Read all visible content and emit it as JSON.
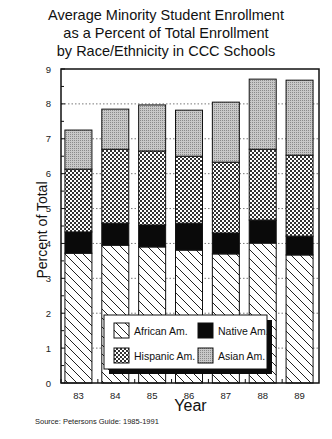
{
  "chart": {
    "title_lines": [
      "Average Minority Student Enrollment",
      "as a Percent of Total Enrollment",
      "by Race/Ethnicity in CCC Schools"
    ],
    "ylabel": "Percent of Total",
    "xlabel": "Year",
    "source": "Source: Petersons Guide: 1985-1991"
  },
  "chart_data": {
    "type": "bar",
    "stacked": true,
    "title": "Average Minority Student Enrollment as a Percent of Total Enrollment by Race/Ethnicity in CCC Schools",
    "xlabel": "Year",
    "ylabel": "Percent of Total",
    "categories": [
      "83",
      "84",
      "85",
      "86",
      "87",
      "88",
      "89"
    ],
    "ylim": [
      0,
      9
    ],
    "yticks": [
      0,
      1,
      2,
      3,
      4,
      5,
      6,
      7,
      8,
      9
    ],
    "grid": "dotted horizontal at integers",
    "legend_position": "inside lower center",
    "series": [
      {
        "name": "African Am.",
        "pattern": "diagonal-hatch",
        "values": [
          3.72,
          3.95,
          3.9,
          3.81,
          3.7,
          4.01,
          3.67
        ]
      },
      {
        "name": "Native Am.",
        "pattern": "solid-black",
        "values": [
          0.61,
          0.63,
          0.63,
          0.77,
          0.6,
          0.66,
          0.54
        ]
      },
      {
        "name": "Hispanic Am.",
        "pattern": "crosshatch",
        "values": [
          1.8,
          2.12,
          2.12,
          1.92,
          2.03,
          2.03,
          2.32
        ]
      },
      {
        "name": "Asian Am.",
        "pattern": "gray-stipple",
        "values": [
          1.12,
          1.15,
          1.32,
          1.32,
          1.72,
          2.01,
          2.15
        ]
      }
    ],
    "totals": [
      7.25,
      7.85,
      7.97,
      7.82,
      8.05,
      8.71,
      8.68
    ],
    "source": "Source: Petersons Guide: 1985-1991"
  },
  "legend": {
    "items": [
      {
        "label": "African Am."
      },
      {
        "label": "Native Am."
      },
      {
        "label": "Hispanic Am."
      },
      {
        "label": "Asian Am."
      }
    ]
  }
}
